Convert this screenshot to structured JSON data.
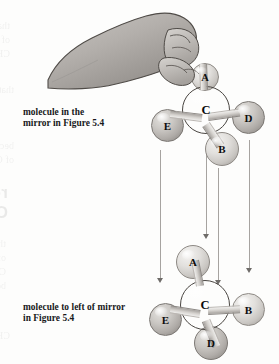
{
  "figure": {
    "captions": {
      "top": {
        "line1": "molecule in the",
        "line2": "mirror in Figure 5.4"
      },
      "bottom": {
        "line1": "molecule to left of mirror",
        "line2": "in Figure 5.4"
      }
    },
    "molecules": [
      {
        "id": "mirror-molecule",
        "name": "molecule in the mirror",
        "center_label": "C",
        "atoms": [
          {
            "label": "A",
            "position": "top"
          },
          {
            "label": "C",
            "position": "center"
          },
          {
            "label": "E",
            "position": "left"
          },
          {
            "label": "D",
            "position": "right"
          },
          {
            "label": "B",
            "position": "bottom-right"
          }
        ]
      },
      {
        "id": "left-of-mirror-molecule",
        "name": "molecule to left of mirror",
        "center_label": "C",
        "atoms": [
          {
            "label": "A",
            "position": "top"
          },
          {
            "label": "C",
            "position": "center"
          },
          {
            "label": "E",
            "position": "left"
          },
          {
            "label": "B",
            "position": "right"
          },
          {
            "label": "D",
            "position": "bottom"
          }
        ]
      }
    ],
    "arrows": {
      "count": 4,
      "direction": "down",
      "description": "correspondence arrows from mirror molecule to molecule left of mirror"
    },
    "hand": {
      "name": "hand-illustration",
      "description": "hand grasping atom A of the mirror molecule"
    },
    "colors": {
      "carbon": "#7a7671",
      "substituent_light": "#e2e0dd",
      "substituent_mid": "#cbc8c4",
      "arrow": "#a6a3a0",
      "text": "#17181a",
      "background": "#fdfdfc"
    },
    "background_bleed": [
      "reogenic Centers, the Ste",
      "Carbon Atom) #group: stere",
      "that have a carbon atom",
      "of CH2ClBr is not equal to",
      "CH3 ... configuration of CH3CH2",
      "becomes a stereocenter atom"
    ]
  }
}
